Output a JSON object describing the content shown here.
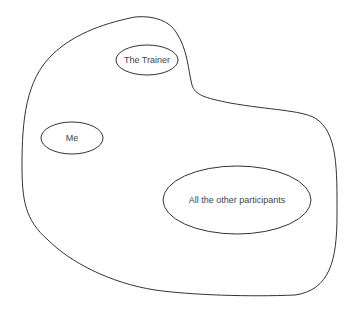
{
  "diagram": {
    "outer_region": {
      "label": ""
    },
    "nodes": [
      {
        "id": "trainer",
        "label": "The Trainer"
      },
      {
        "id": "me",
        "label": "Me"
      },
      {
        "id": "others",
        "label": "All the other participants"
      }
    ],
    "colors": {
      "stroke": "#333333",
      "text": "#444444",
      "background": "#ffffff"
    }
  }
}
